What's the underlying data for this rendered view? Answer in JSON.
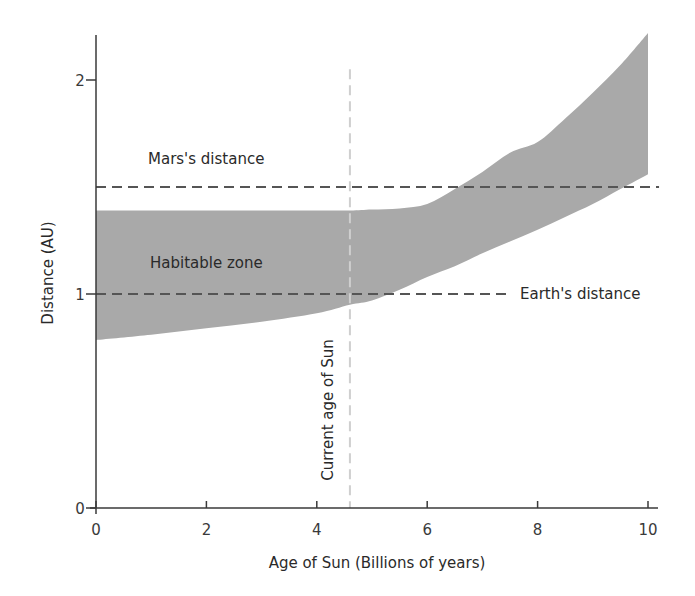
{
  "chart_data": {
    "type": "area",
    "title": "",
    "xlabel": "Age of Sun (Billions of years)",
    "ylabel": "Distance (AU)",
    "xlim": [
      0,
      10
    ],
    "ylim": [
      0,
      2.2
    ],
    "x_ticks": [
      "0",
      "2",
      "4",
      "6",
      "8",
      "10"
    ],
    "y_ticks": [
      "0",
      "1",
      "2"
    ],
    "grid": false,
    "legend": null,
    "band": {
      "name": "Habitable zone",
      "x": [
        0,
        1,
        2,
        3,
        4,
        4.6,
        5,
        5.5,
        6,
        6.5,
        7,
        7.5,
        8,
        8.5,
        9,
        9.5,
        10
      ],
      "upper": [
        1.39,
        1.39,
        1.39,
        1.39,
        1.39,
        1.39,
        1.395,
        1.4,
        1.42,
        1.49,
        1.57,
        1.66,
        1.71,
        1.82,
        1.94,
        2.07,
        2.22
      ],
      "lower": [
        0.785,
        0.81,
        0.84,
        0.87,
        0.91,
        0.95,
        0.97,
        1.02,
        1.08,
        1.13,
        1.19,
        1.245,
        1.3,
        1.36,
        1.42,
        1.49,
        1.56
      ],
      "color": "#a9a9a9"
    },
    "reference_lines": [
      {
        "name": "Mars's distance",
        "orientation": "horizontal",
        "y": 1.5,
        "x_range": [
          0,
          10.2
        ],
        "style": "dashed",
        "color": "#555555"
      },
      {
        "name": "Earth's distance",
        "orientation": "horizontal",
        "y": 1.0,
        "x_range": [
          0,
          7.5
        ],
        "style": "dashed",
        "color": "#555555"
      },
      {
        "name": "Current age of Sun",
        "orientation": "vertical",
        "x": 4.6,
        "y_range": [
          0,
          2.05
        ],
        "style": "dashed",
        "color": "#cfcfcf"
      }
    ],
    "annotations": [
      {
        "text": "Mars's distance",
        "x": 2.2,
        "y": 1.64
      },
      {
        "text": "Habitable zone",
        "x": 2.2,
        "y": 1.15
      },
      {
        "text": "Earth's distance",
        "x": 9.7,
        "y": 1.0
      },
      {
        "text": "Current age of Sun",
        "x": 4.2,
        "y": 0.47,
        "rotation": -90
      }
    ]
  }
}
